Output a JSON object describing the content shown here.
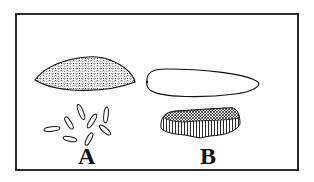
{
  "figure": {
    "panels": [
      {
        "id": "A",
        "label": "A",
        "upper_shape": "stippled-lens",
        "lower_shape": "scattered-elongate-grains",
        "grain_count": 8
      },
      {
        "id": "B",
        "label": "B",
        "upper_shape": "outline-teardrop",
        "lower_shape": "ribbed-cluster"
      }
    ],
    "colors": {
      "ink": "#111111",
      "frame": "#2a2a2a",
      "background": "#ffffff"
    }
  }
}
